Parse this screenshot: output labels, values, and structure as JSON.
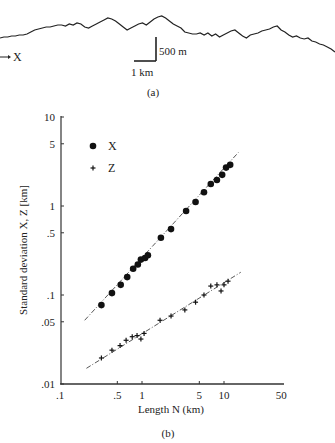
{
  "panel_a": {
    "caption": "(a)",
    "direction_label": "X",
    "scale_vertical_label": "500 m",
    "scale_horizontal_label": "1 km"
  },
  "panel_b": {
    "caption": "(b)"
  },
  "chart_data": [
    {
      "type": "line",
      "title": "(a) Topographic profile",
      "xlabel": "X",
      "ylabel": "",
      "annotations": [
        "500 m (vertical scale bar)",
        "1 km (horizontal scale bar)"
      ],
      "profile_y_px": [
        38,
        37,
        37,
        36,
        36,
        35,
        35,
        34,
        32,
        30,
        29,
        28,
        27,
        27,
        26,
        25,
        25,
        26,
        24,
        25,
        23,
        24,
        27,
        28,
        26,
        24,
        22,
        20,
        18,
        19,
        21,
        24,
        27,
        30,
        28,
        26,
        24,
        23,
        25,
        22,
        19,
        17,
        16,
        18,
        21,
        24,
        26,
        28,
        32,
        33,
        34,
        34,
        33,
        35,
        33,
        36,
        34,
        37,
        35,
        33,
        31,
        30,
        33,
        36,
        38,
        35,
        34,
        33,
        31,
        30,
        29,
        27,
        26,
        30,
        32,
        35,
        37,
        36,
        38,
        39,
        38,
        41,
        42,
        44,
        45,
        47,
        49,
        52
      ]
    },
    {
      "type": "scatter",
      "title": "(b)",
      "xlabel": "Length N (km)",
      "ylabel": "Standard deviation X, Z [km]",
      "xscale": "log",
      "yscale": "log",
      "xlim": [
        0.1,
        50
      ],
      "ylim": [
        0.01,
        10
      ],
      "x_ticks": [
        ".1",
        ".5",
        "1",
        "5",
        "10",
        "50"
      ],
      "x_tick_values": [
        0.1,
        0.5,
        1,
        5,
        10,
        50
      ],
      "y_ticks": [
        ".01",
        ".05",
        ".1",
        ".5",
        "1",
        "5",
        "10"
      ],
      "y_tick_values": [
        0.01,
        0.05,
        0.1,
        0.5,
        1,
        5,
        10
      ],
      "grid": false,
      "legend_position": "upper left",
      "legend": [
        {
          "label": "X",
          "marker": "circle"
        },
        {
          "label": "Z",
          "marker": "plus"
        }
      ],
      "series": [
        {
          "name": "X",
          "marker": "circle",
          "x": [
            0.32,
            0.43,
            0.55,
            0.66,
            0.78,
            0.89,
            0.97,
            1.09,
            1.18,
            1.7,
            2.26,
            3.45,
            4.5,
            5.7,
            6.9,
            8.2,
            9.5,
            10.6,
            11.9
          ],
          "y": [
            0.077,
            0.105,
            0.13,
            0.159,
            0.197,
            0.22,
            0.25,
            0.26,
            0.28,
            0.44,
            0.55,
            0.88,
            1.11,
            1.43,
            1.77,
            1.96,
            2.24,
            2.7,
            2.9
          ],
          "fit_line": {
            "x": [
              0.2,
              15
            ],
            "y": [
              0.052,
              4.0
            ]
          }
        },
        {
          "name": "Z",
          "marker": "plus",
          "x": [
            0.32,
            0.43,
            0.54,
            0.64,
            0.76,
            0.87,
            0.97,
            1.06,
            1.66,
            2.26,
            3.33,
            4.5,
            5.7,
            6.9,
            8.2,
            9.2,
            10,
            11.2
          ],
          "y": [
            0.0196,
            0.024,
            0.027,
            0.031,
            0.034,
            0.035,
            0.032,
            0.037,
            0.052,
            0.058,
            0.068,
            0.083,
            0.1,
            0.126,
            0.13,
            0.111,
            0.13,
            0.143
          ],
          "fit_line": {
            "x": [
              0.21,
              16
            ],
            "y": [
              0.015,
              0.18
            ]
          }
        }
      ]
    }
  ]
}
